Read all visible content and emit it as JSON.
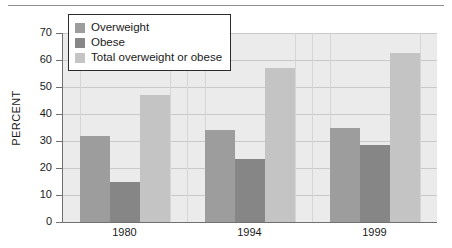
{
  "chart_data": {
    "type": "bar",
    "title": "",
    "subtitle": "",
    "xlabel": "",
    "ylabel": "PERCENT",
    "categories": [
      "1980",
      "1994",
      "1999"
    ],
    "series": [
      {
        "name": "Overweight",
        "color": "#9d9d9d",
        "values": [
          32,
          34,
          35
        ]
      },
      {
        "name": "Obese",
        "color": "#868686",
        "values": [
          15,
          23.5,
          28.5
        ]
      },
      {
        "name": "Total overweight or obese",
        "color": "#c4c4c4",
        "values": [
          47,
          57,
          62.5
        ]
      }
    ],
    "ylim": [
      0,
      70
    ],
    "ytick_labels": [
      "70",
      "60",
      "50",
      "40",
      "30",
      "20",
      "10",
      "0"
    ],
    "ytick_values": [
      70,
      60,
      50,
      40,
      30,
      20,
      10,
      0
    ],
    "grid": true,
    "grid_axis": "both",
    "legend_position": "top-left",
    "plot_background": "#ebebeb"
  },
  "legend": {
    "items": [
      {
        "label": "Overweight",
        "swatch": "overweight-swatch"
      },
      {
        "label": "Obese",
        "swatch": "obese-swatch"
      },
      {
        "label": "Total overweight or obese",
        "swatch": "total-swatch"
      }
    ]
  }
}
